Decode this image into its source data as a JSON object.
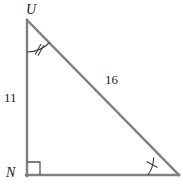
{
  "figure": {
    "type": "right-triangle-geometry-diagram",
    "stroke_color": "#808080",
    "mark_color": "#4d4d4d",
    "text_color": "#1a1a1a",
    "background_color": "#ffffff",
    "stroke_width": 2,
    "vertices": [
      {
        "name": "U",
        "label": "U",
        "x": 26,
        "y": 20
      },
      {
        "name": "N",
        "label": "N",
        "x": 26,
        "y": 176
      },
      {
        "name": "unlabeled-right",
        "label": "",
        "x": 178,
        "y": 176
      }
    ],
    "sides": [
      {
        "name": "leg-UN",
        "label": "11",
        "from": "U",
        "to": "N"
      },
      {
        "name": "hypotenuse-U-right",
        "label": "16",
        "from": "U",
        "to": "unlabeled-right"
      },
      {
        "name": "leg-base",
        "label": "",
        "from": "N",
        "to": "unlabeled-right"
      }
    ],
    "angle_marks": [
      {
        "name": "angle-U",
        "vertex": "U",
        "style": "arc",
        "ticks": 2
      },
      {
        "name": "angle-N",
        "vertex": "N",
        "style": "right-angle-square",
        "ticks": 0
      },
      {
        "name": "angle-right-vertex",
        "vertex": "unlabeled-right",
        "style": "arc",
        "ticks": 1
      }
    ]
  },
  "labels": {
    "vertex_U": "U",
    "vertex_N": "N",
    "leg_length": "11",
    "hypotenuse_length": "16"
  }
}
